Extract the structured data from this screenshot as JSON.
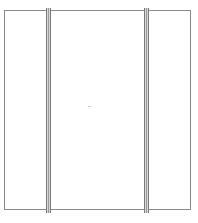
{
  "diagram": {
    "type": "panel-layout",
    "panels": [
      {
        "id": "left-panel",
        "label": ""
      },
      {
        "id": "center-panel",
        "label": ""
      },
      {
        "id": "right-panel",
        "label": ""
      }
    ],
    "dividers": [
      {
        "id": "left-divider",
        "style": "double-line"
      },
      {
        "id": "right-divider",
        "style": "double-line"
      }
    ],
    "caption": "",
    "colors": {
      "stroke": "#8a8a8a",
      "divider_fill": "#d8d8d8",
      "background": "#ffffff"
    }
  }
}
